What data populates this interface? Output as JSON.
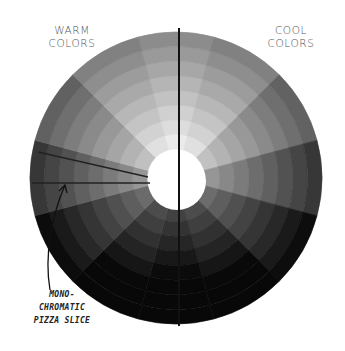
{
  "labels": {
    "warm_line1": "WARM",
    "warm_line2": "COLORS",
    "cool_line1": "COOL",
    "cool_line2": "COLORS",
    "annotation_line1": "MONO-",
    "annotation_line2": "CHROMATIC",
    "annotation_line3": "PIZZA SLICE"
  },
  "wheel": {
    "center_x": 176,
    "center_y": 178,
    "outer_radius": 146,
    "inner_radius": 29,
    "sectors": 12,
    "rings": 8,
    "divider_color": "#111111",
    "background": "#ffffff"
  },
  "icons": {
    "arrow": "curved-arrow-icon"
  }
}
